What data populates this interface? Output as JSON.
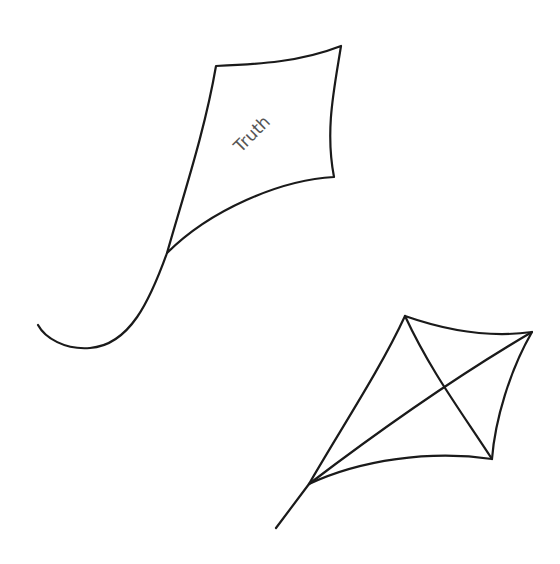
{
  "drawing": {
    "description": "Line drawing of two kites on white background",
    "colors": {
      "background": "#ffffff",
      "stroke": "#1a1a1a",
      "label": "#555555"
    },
    "kites": [
      {
        "id": "labeled-kite",
        "label": "Truth",
        "has_cross_spars": false,
        "has_tail_string": true
      },
      {
        "id": "plain-kite",
        "label": "",
        "has_cross_spars": true,
        "has_tail_string": true
      }
    ]
  }
}
